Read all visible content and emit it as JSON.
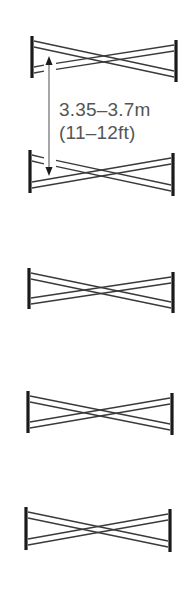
{
  "diagram": {
    "fence_count": 5,
    "fence_type": "cross-pole",
    "colors": {
      "post": "#1a1a1a",
      "pole": "#3a3a3a",
      "arrow": "#6a6a6a",
      "label": "#555555",
      "background": "#ffffff"
    },
    "fences": [
      {
        "id": 1,
        "left_x": 32,
        "right_x": 176,
        "left_top": 36,
        "right_top": 40,
        "height": 42
      },
      {
        "id": 2,
        "left_x": 30,
        "right_x": 173,
        "left_top": 150,
        "right_top": 153,
        "height": 43
      },
      {
        "id": 3,
        "left_x": 29,
        "right_x": 173,
        "left_top": 268,
        "right_top": 272,
        "height": 41
      },
      {
        "id": 4,
        "left_x": 28,
        "right_x": 172,
        "left_top": 391,
        "right_top": 393,
        "height": 42
      },
      {
        "id": 5,
        "left_x": 26,
        "right_x": 170,
        "left_top": 507,
        "right_top": 509,
        "height": 43
      }
    ],
    "measurement": {
      "metric_label": "3.35–3.7m",
      "imperial_label": "(11–12ft)",
      "arrow_icon": "double-headed-vertical-arrow",
      "between_fences": [
        1,
        2
      ]
    }
  }
}
